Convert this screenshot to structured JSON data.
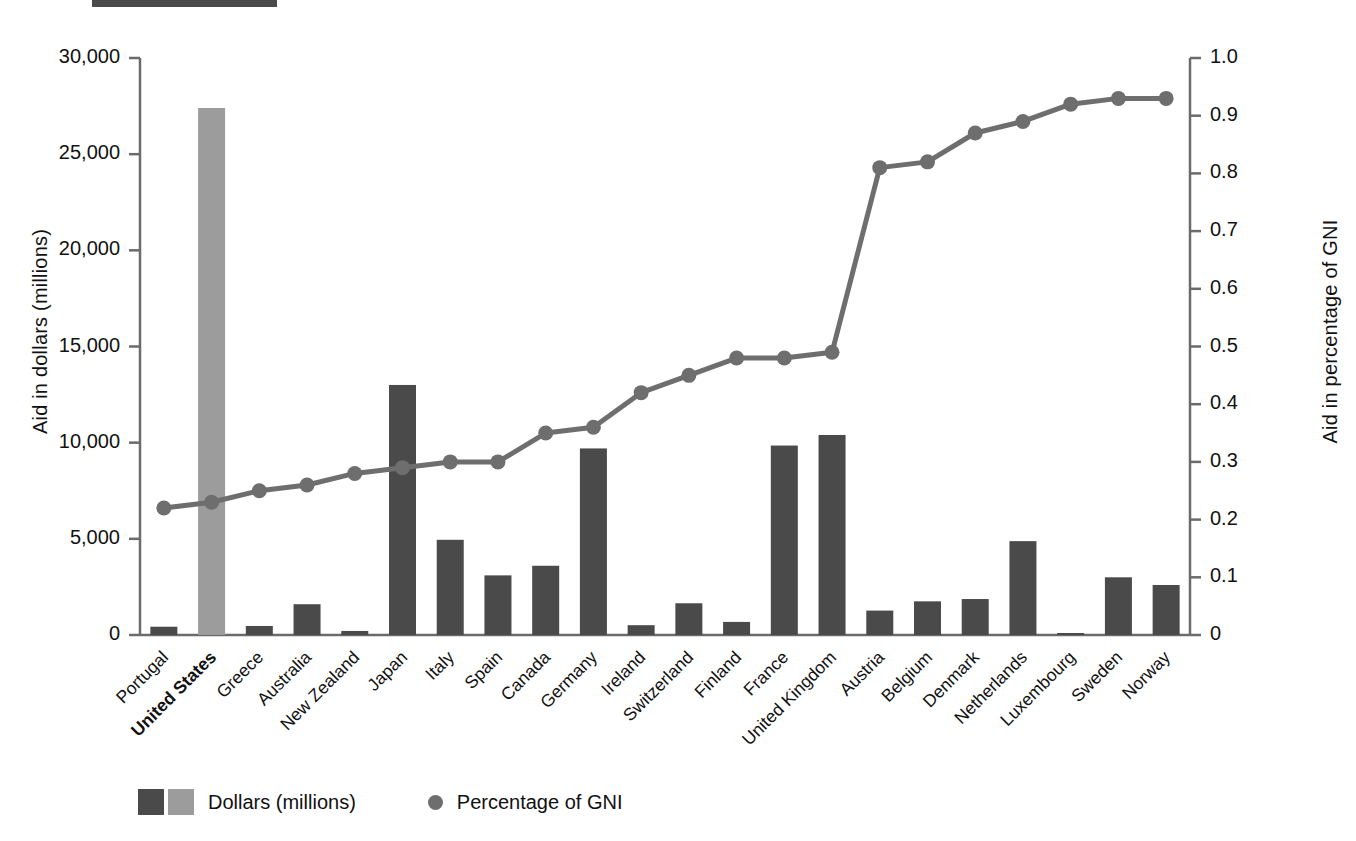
{
  "chart_data": {
    "type": "bar",
    "title": "",
    "subtitle": "",
    "xlabel": "",
    "ylabel": "Aid in dollars (millions)",
    "y2label": "Aid in percentage of GNI",
    "ylim": [
      0,
      30000
    ],
    "y2lim": [
      0,
      1.0
    ],
    "grid": false,
    "legend_position": "bottom-left",
    "y_ticks": [
      "0",
      "5,000",
      "10,000",
      "15,000",
      "20,000",
      "25,000",
      "30,000"
    ],
    "y_tick_values": [
      0,
      5000,
      10000,
      15000,
      20000,
      25000,
      30000
    ],
    "y2_ticks": [
      "0",
      "0.1",
      "0.2",
      "0.3",
      "0.4",
      "0.5",
      "0.6",
      "0.7",
      "0.8",
      "0.9",
      "1.0"
    ],
    "y2_tick_values": [
      0,
      0.1,
      0.2,
      0.3,
      0.4,
      0.5,
      0.6,
      0.7,
      0.8,
      0.9,
      1.0
    ],
    "categories": [
      "Portugal",
      "United States",
      "Greece",
      "Australia",
      "New Zealand",
      "Japan",
      "Italy",
      "Spain",
      "Canada",
      "Germany",
      "Ireland",
      "Switzerland",
      "Finland",
      "France",
      "United Kingdom",
      "Austria",
      "Belgium",
      "Denmark",
      "Netherlands",
      "Luxembourg",
      "Sweden",
      "Norway"
    ],
    "highlighted_category": "United States",
    "series": [
      {
        "name": "Dollars (millions)",
        "type": "bar",
        "axis": "left",
        "color": "#4a4a4a",
        "highlight_color": "#9c9c9c",
        "values": [
          430,
          27400,
          470,
          1600,
          210,
          13000,
          4950,
          3100,
          3600,
          9700,
          510,
          1650,
          680,
          9850,
          10400,
          1270,
          1750,
          1870,
          4880,
          80,
          3000,
          2600
        ]
      },
      {
        "name": "Percentage of GNI",
        "type": "line",
        "axis": "right",
        "color": "#6e6e6e",
        "values": [
          0.22,
          0.23,
          0.25,
          0.26,
          0.28,
          0.29,
          0.3,
          0.3,
          0.35,
          0.36,
          0.42,
          0.45,
          0.48,
          0.48,
          0.49,
          0.81,
          0.82,
          0.87,
          0.89,
          0.92,
          0.93,
          0.93
        ]
      }
    ],
    "legend": [
      {
        "label": "Dollars (millions)",
        "marker": "double-square",
        "colors": [
          "#4a4a4a",
          "#9c9c9c"
        ]
      },
      {
        "label": "Percentage of GNI",
        "marker": "dot",
        "colors": [
          "#6e6e6e"
        ]
      }
    ]
  },
  "colors": {
    "bar_dark": "#4a4a4a",
    "bar_light": "#9c9c9c",
    "line": "#6e6e6e",
    "axis": "#6b6b6b",
    "text": "#111111",
    "background": "#ffffff"
  }
}
